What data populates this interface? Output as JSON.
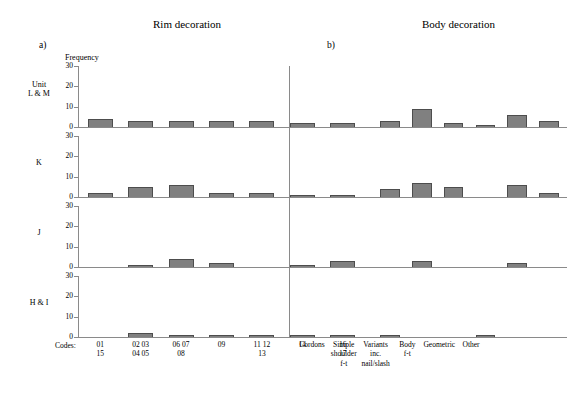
{
  "titles": {
    "rim": "Rim decoration",
    "body": "Body decoration"
  },
  "panel_letters": {
    "a": "a)",
    "b": "b)"
  },
  "axis": {
    "ylabel": "Frequency",
    "codes_label": "Codes:",
    "yticks": [
      "30",
      "20",
      "10",
      "0"
    ],
    "ylim_max": 30
  },
  "row_labels": [
    "Unit\nL & M",
    "K",
    "J",
    "H & I"
  ],
  "colors": {
    "bar_fill": "#808080",
    "bar_stroke": "#4d4d4d",
    "axis": "#8a8a8a"
  },
  "chart_data": {
    "type": "bar",
    "xlabel": "Codes:",
    "ylabel": "Frequency",
    "ylim": [
      0,
      30
    ],
    "yticks": [
      0,
      10,
      20,
      30
    ],
    "grid": false,
    "legend_position": "none",
    "panels": [
      {
        "row_label": "Unit L & M",
        "rim": {
          "categories": [
            "01 15",
            "02 03 04 05",
            "06 07 08",
            "09",
            "11 12 13",
            "14",
            "16 17"
          ],
          "values": [
            4,
            3,
            3,
            3,
            3,
            2,
            2
          ]
        },
        "body": {
          "categories": [
            "Cordons",
            "Simple shoulder f-t",
            "Variants inc. nail/slash",
            "Body f-t",
            "Geometric",
            "Other"
          ],
          "values": [
            3,
            9,
            2,
            1,
            6,
            3
          ]
        }
      },
      {
        "row_label": "K",
        "rim": {
          "categories": [
            "01 15",
            "02 03 04 05",
            "06 07 08",
            "09",
            "11 12 13",
            "14",
            "16 17"
          ],
          "values": [
            2,
            5,
            6,
            2,
            2,
            1,
            1
          ]
        },
        "body": {
          "categories": [
            "Cordons",
            "Simple shoulder f-t",
            "Variants inc. nail/slash",
            "Body f-t",
            "Geometric",
            "Other"
          ],
          "values": [
            4,
            7,
            5,
            0,
            6,
            2
          ]
        }
      },
      {
        "row_label": "J",
        "rim": {
          "categories": [
            "01 15",
            "02 03 04 05",
            "06 07 08",
            "09",
            "11 12 13",
            "14",
            "16 17"
          ],
          "values": [
            0,
            1,
            4,
            2,
            0,
            1,
            3
          ]
        },
        "body": {
          "categories": [
            "Cordons",
            "Simple shoulder f-t",
            "Variants inc. nail/slash",
            "Body f-t",
            "Geometric",
            "Other"
          ],
          "values": [
            0,
            3,
            0,
            0,
            2,
            0
          ]
        }
      },
      {
        "row_label": "H & I",
        "rim": {
          "categories": [
            "01 15",
            "02 03 04 05",
            "06 07 08",
            "09",
            "11 12 13",
            "14",
            "16 17"
          ],
          "values": [
            0,
            2,
            1,
            1,
            1,
            1,
            1
          ]
        },
        "body": {
          "categories": [
            "Cordons",
            "Simple shoulder f-t",
            "Variants inc. nail/slash",
            "Body f-t",
            "Geometric",
            "Other"
          ],
          "values": [
            1,
            0,
            0,
            1,
            0,
            0
          ]
        }
      }
    ],
    "x_tick_labels": {
      "rim": [
        "01\n15",
        "02 03\n04 05",
        "06 07\n08",
        "09",
        "11 12\n13",
        "14",
        "16\n17"
      ],
      "body": [
        "Cordons",
        "Simple\nshoulder\nf-t",
        "Variants\ninc.\nnail/slash",
        "Body\nf-t",
        "Geometric",
        "Other"
      ]
    }
  }
}
